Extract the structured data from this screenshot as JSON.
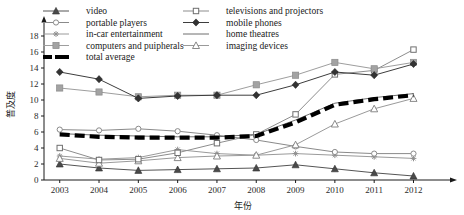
{
  "chart_data": {
    "type": "line",
    "title": "",
    "xlabel": "年份",
    "ylabel": "普及度",
    "x": [
      2003,
      2004,
      2005,
      2006,
      2007,
      2008,
      2009,
      2010,
      2011,
      2012
    ],
    "xticklabels": [
      "2003",
      "2004",
      "2005",
      "2006",
      "2007",
      "2008",
      "2009",
      "2010",
      "2011",
      "2012"
    ],
    "yticklabels": [
      "0",
      "2",
      "4",
      "6",
      "8",
      "10",
      "12",
      "14",
      "16",
      "18"
    ],
    "ylim": [
      0,
      19
    ],
    "xlim": [
      2002.6,
      2012.7
    ],
    "grid": false,
    "legend_position": "top",
    "legend_columns": 2,
    "series": [
      {
        "name": "video",
        "marker": "filled-triangle-up",
        "color": "#555555",
        "line_style": "solid",
        "values": [
          2.0,
          1.5,
          1.2,
          1.3,
          1.4,
          1.5,
          1.9,
          1.4,
          0.9,
          0.5
        ]
      },
      {
        "name": "portable players",
        "marker": "open-circle",
        "color": "#8a8a8a",
        "line_style": "solid",
        "values": [
          6.3,
          6.2,
          6.4,
          6.1,
          5.6,
          5.0,
          4.2,
          3.5,
          3.3,
          3.3
        ]
      },
      {
        "name": "in-car entertainment",
        "marker": "cross",
        "color": "#9a9a9a",
        "line_style": "solid",
        "values": [
          3.0,
          2.6,
          2.8,
          3.8,
          3.3,
          3.1,
          3.3,
          3.1,
          2.9,
          2.7
        ]
      },
      {
        "name": "computers and puipherals",
        "marker": "filled-square",
        "color": "#9e9e9e",
        "line_style": "solid",
        "values": [
          11.5,
          11.0,
          10.4,
          10.6,
          10.6,
          11.9,
          13.1,
          14.7,
          13.9,
          14.7
        ]
      },
      {
        "name": "televisions and projectors",
        "marker": "open-square",
        "color": "#8d8d8d",
        "line_style": "solid",
        "values": [
          4.0,
          2.5,
          2.6,
          3.4,
          4.6,
          5.7,
          8.2,
          13.2,
          13.7,
          16.3
        ]
      },
      {
        "name": "mobile phones",
        "marker": "filled-diamond",
        "color": "#3d3d3d",
        "line_style": "solid",
        "values": [
          13.5,
          12.6,
          10.2,
          10.5,
          10.6,
          10.6,
          11.9,
          13.5,
          13.1,
          14.5
        ]
      },
      {
        "name": "home theatres",
        "marker": "none",
        "color": "#6e6e6e",
        "line_style": "solid",
        "values": [
          5.8,
          5.6,
          5.5,
          5.4,
          5.4,
          5.7,
          7.5,
          9.6,
          10.3,
          10.8
        ]
      },
      {
        "name": "imaging devices",
        "marker": "open-triangle-up",
        "color": "#9a9a9a",
        "line_style": "solid",
        "values": [
          2.7,
          2.1,
          2.4,
          2.8,
          3.0,
          3.1,
          4.4,
          7.0,
          8.9,
          10.2
        ]
      },
      {
        "name": "total average",
        "marker": "none",
        "color": "#000000",
        "line_style": "dashed-thick",
        "values": [
          5.7,
          5.4,
          5.3,
          5.3,
          5.3,
          5.5,
          7.2,
          9.4,
          10.1,
          10.6
        ]
      }
    ],
    "legend_order": [
      "video",
      "televisions and projectors",
      "portable players",
      "mobile phones",
      "in-car entertainment",
      "home theatres",
      "computers and puipherals",
      "imaging devices",
      "total average"
    ]
  }
}
